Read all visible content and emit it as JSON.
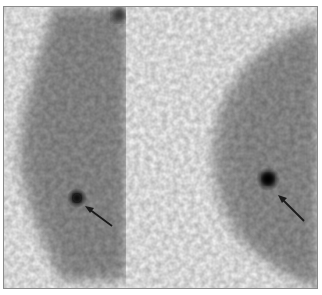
{
  "figure": {
    "type": "scintimammography",
    "panels": [
      {
        "id": "left",
        "view": "lateral",
        "lesion": {
          "cx": 76,
          "cy": 197,
          "label": "focal uptake"
        },
        "arrow": {
          "x1": 111,
          "y1": 225,
          "x2": 85,
          "y2": 206
        }
      },
      {
        "id": "right",
        "view": "lateral",
        "lesion": {
          "cx": 267,
          "cy": 178,
          "label": "focal uptake"
        },
        "arrow": {
          "x1": 303,
          "y1": 220,
          "x2": 278,
          "y2": 195
        }
      }
    ],
    "colors": {
      "background": "#fbfbfb",
      "tissue": "#9a9a9a",
      "lesion": "#111111",
      "arrow": "#1a1a1a",
      "border": "#8a8a8a"
    }
  }
}
